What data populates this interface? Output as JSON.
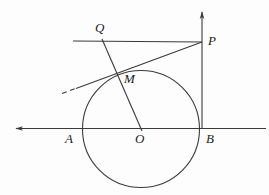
{
  "figure": {
    "type": "plane-geometry-diagram",
    "background_color": "#fdfdfd",
    "stroke_color": "#3a3a3a",
    "label_color": "#1c1c1c"
  },
  "labels": {
    "Q": "Q",
    "P": "P",
    "M": "M",
    "A": "A",
    "O": "O",
    "B": "B"
  },
  "points": {
    "Q": {
      "x": 103,
      "y": 38
    },
    "P": {
      "x": 202,
      "y": 42
    },
    "M": {
      "x": 118,
      "y": 76
    },
    "A": {
      "x": 83,
      "y": 129
    },
    "O": {
      "x": 141,
      "y": 129
    },
    "B": {
      "x": 200,
      "y": 129
    }
  },
  "label_positions": {
    "Q": {
      "x": 95,
      "y": 21
    },
    "P": {
      "x": 208,
      "y": 34
    },
    "M": {
      "x": 124,
      "y": 72
    },
    "A": {
      "x": 65,
      "y": 132
    },
    "O": {
      "x": 135,
      "y": 132
    },
    "B": {
      "x": 206,
      "y": 132
    }
  },
  "shapes": {
    "circle": {
      "cx": 141,
      "cy": 129,
      "r": 58.5
    },
    "horizontal_axis": {
      "x1": 13,
      "y1": 128.5,
      "x2": 266,
      "y2": 128.5,
      "arrow": "left"
    },
    "vertical_line": {
      "x1": 202,
      "y1": 10,
      "x2": 202,
      "y2": 129,
      "arrow": "up"
    },
    "line_QP": {
      "x1": 73,
      "y1": 41,
      "x2": 202,
      "y2": 42
    },
    "line_QO": {
      "x1": 103,
      "y1": 41,
      "x2": 141,
      "y2": 129
    },
    "tangent_MP": {
      "x1": 75,
      "y1": 88,
      "x2": 202,
      "y2": 42,
      "tangent_point": "M"
    },
    "tangent_dashed_tail": {
      "x1": 62,
      "y1": 93,
      "x2": 76,
      "y2": 88
    }
  }
}
